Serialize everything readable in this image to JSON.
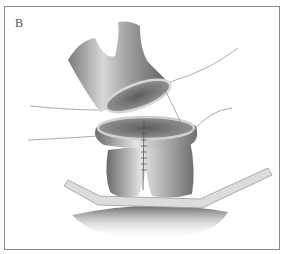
{
  "figure": {
    "panel_label": "B",
    "colors": {
      "border": "#8a8a8a",
      "tissue_dark": "#5a5a5a",
      "tissue_mid": "#9a9a9a",
      "tissue_light": "#e2e2e2",
      "suture": "#777777"
    }
  }
}
